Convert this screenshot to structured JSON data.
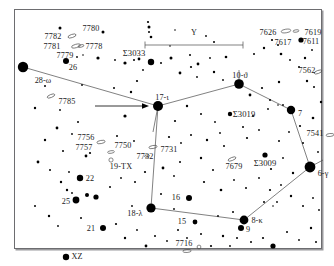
{
  "chart": {
    "title": "",
    "type": "star-chart",
    "target_marker": {
      "type": "arrow",
      "points_to": "17-i",
      "note": "horizontal arrow pointing right at the star labelled 17-i"
    },
    "scale_bar": {
      "label": "",
      "shown": true
    },
    "colors": {
      "background": "#ffffff",
      "star": "#000000",
      "constellation_line": "#4a4a4a",
      "frame": "#6d6d70",
      "label": "#1a1a1a"
    }
  },
  "labels": [
    {
      "id": "l1",
      "text": "7782",
      "x": 38,
      "y": 27,
      "kind": "num"
    },
    {
      "id": "l2",
      "text": "7780",
      "x": 76,
      "y": 19,
      "kind": "num"
    },
    {
      "id": "l3",
      "text": "7781",
      "x": 37,
      "y": 37,
      "kind": "num"
    },
    {
      "id": "l4",
      "text": "7778",
      "x": 79,
      "y": 37,
      "kind": "num"
    },
    {
      "id": "l5",
      "text": "7779",
      "x": 50,
      "y": 46,
      "kind": "num"
    },
    {
      "id": "l6",
      "text": "26",
      "x": 58,
      "y": 58,
      "kind": "num"
    },
    {
      "id": "l7",
      "text": "Σ3033",
      "x": 119,
      "y": 43,
      "kind": "sz"
    },
    {
      "id": "l8",
      "text": "Y",
      "x": 179,
      "y": 23,
      "kind": "bayer"
    },
    {
      "id": "l9",
      "text": "7626",
      "x": 253,
      "y": 23,
      "kind": "num"
    },
    {
      "id": "l10",
      "text": "7619",
      "x": 298,
      "y": 23,
      "kind": "num"
    },
    {
      "id": "l11",
      "text": "7617",
      "x": 268,
      "y": 33,
      "kind": "num"
    },
    {
      "id": "l12",
      "text": "7611",
      "x": 296,
      "y": 32,
      "kind": "num"
    },
    {
      "id": "l13",
      "text": "7562",
      "x": 292,
      "y": 61,
      "kind": "num"
    },
    {
      "id": "l14",
      "text": "28-ω",
      "x": 28,
      "y": 71,
      "kind": "bayer"
    },
    {
      "id": "l15",
      "text": "10-ϑ",
      "x": 225,
      "y": 66,
      "kind": "bayer"
    },
    {
      "id": "l16",
      "text": "17-ι",
      "x": 147,
      "y": 88,
      "kind": "bayer"
    },
    {
      "id": "l17",
      "text": "7785",
      "x": 52,
      "y": 92,
      "kind": "num"
    },
    {
      "id": "l18",
      "text": "Σ3019",
      "x": 229,
      "y": 104,
      "kind": "sz"
    },
    {
      "id": "l19",
      "text": "7",
      "x": 285,
      "y": 104,
      "kind": "num"
    },
    {
      "id": "l20",
      "text": "7541",
      "x": 300,
      "y": 124,
      "kind": "num"
    },
    {
      "id": "l21",
      "text": "7756",
      "x": 71,
      "y": 128,
      "kind": "num"
    },
    {
      "id": "l22",
      "text": "7757",
      "x": 69,
      "y": 138,
      "kind": "num"
    },
    {
      "id": "l23",
      "text": "7750",
      "x": 108,
      "y": 136,
      "kind": "num"
    },
    {
      "id": "l24",
      "text": "7731",
      "x": 154,
      "y": 140,
      "kind": "num"
    },
    {
      "id": "l25",
      "text": "7732",
      "x": 130,
      "y": 147,
      "kind": "num"
    },
    {
      "id": "l26",
      "text": "19-TX",
      "x": 106,
      "y": 157,
      "kind": "bayer"
    },
    {
      "id": "l27",
      "text": "7679",
      "x": 219,
      "y": 157,
      "kind": "num"
    },
    {
      "id": "l28",
      "text": "Σ3009",
      "x": 250,
      "y": 153,
      "kind": "sz"
    },
    {
      "id": "l29",
      "text": "6-γ",
      "x": 308,
      "y": 164,
      "kind": "bayer"
    },
    {
      "id": "l30",
      "text": "22",
      "x": 75,
      "y": 169,
      "kind": "num"
    },
    {
      "id": "l31",
      "text": "25",
      "x": 51,
      "y": 192,
      "kind": "num"
    },
    {
      "id": "l32",
      "text": "16",
      "x": 161,
      "y": 188,
      "kind": "num"
    },
    {
      "id": "l33",
      "text": "18-λ",
      "x": 120,
      "y": 204,
      "kind": "bayer"
    },
    {
      "id": "l34",
      "text": "8-κ",
      "x": 242,
      "y": 211,
      "kind": "bayer"
    },
    {
      "id": "l35",
      "text": "15",
      "x": 167,
      "y": 212,
      "kind": "num"
    },
    {
      "id": "l36",
      "text": "9",
      "x": 233,
      "y": 220,
      "kind": "num"
    },
    {
      "id": "l37",
      "text": "21",
      "x": 76,
      "y": 219,
      "kind": "num"
    },
    {
      "id": "l38",
      "text": "7716",
      "x": 169,
      "y": 234,
      "kind": "num"
    },
    {
      "id": "l39",
      "text": "XZ",
      "x": 62,
      "y": 247,
      "kind": "bayer"
    }
  ],
  "chart_data": {
    "type": "scatter",
    "xlabel": "",
    "ylabel": "",
    "xlim": [
      0,
      308
    ],
    "ylim": [
      0,
      240
    ],
    "grid": false,
    "legend": "none",
    "note": "Dot radius encodes stellar magnitude: larger dot = brighter star.",
    "named_stars": [
      {
        "name": "28-ω",
        "x": 8,
        "y": 57,
        "r": 5.2
      },
      {
        "name": "26",
        "x": 51,
        "y": 51,
        "r": 3.0
      },
      {
        "name": "17-ι",
        "x": 143,
        "y": 96,
        "r": 5.0
      },
      {
        "name": "10-ϑ",
        "x": 224,
        "y": 74,
        "r": 4.8
      },
      {
        "name": "7",
        "x": 276,
        "y": 100,
        "r": 4.2
      },
      {
        "name": "6-γ",
        "x": 295,
        "y": 157,
        "r": 5.4
      },
      {
        "name": "18-λ",
        "x": 136,
        "y": 198,
        "r": 4.6
      },
      {
        "name": "8-κ",
        "x": 229,
        "y": 210,
        "r": 4.4
      },
      {
        "name": "9",
        "x": 226,
        "y": 218,
        "r": 3.0
      },
      {
        "name": "16",
        "x": 174,
        "y": 188,
        "r": 3.0
      },
      {
        "name": "15",
        "x": 180,
        "y": 212,
        "r": 2.4
      },
      {
        "name": "22",
        "x": 65,
        "y": 168,
        "r": 3.2
      },
      {
        "name": "25",
        "x": 61,
        "y": 190,
        "r": 3.4
      },
      {
        "name": "21",
        "x": 88,
        "y": 218,
        "r": 3.0
      },
      {
        "name": "XZ",
        "x": 51,
        "y": 247,
        "r": 3.2
      },
      {
        "name": "Σ3033",
        "x": 136,
        "y": 52,
        "r": 3.2
      },
      {
        "name": "Σ3019",
        "x": 215,
        "y": 104,
        "r": 2.2
      },
      {
        "name": "Σ3009",
        "x": 250,
        "y": 145,
        "r": 2.6
      },
      {
        "name": "7611",
        "x": 286,
        "y": 30,
        "r": 2.6
      },
      {
        "name": "7617",
        "x": 279,
        "y": 26,
        "r": 1.6
      }
    ],
    "constellation_lines": [
      {
        "from": "28-ω",
        "to": "17-ι"
      },
      {
        "from": "17-ι",
        "to": "10-ϑ"
      },
      {
        "from": "10-ϑ",
        "to": "7"
      },
      {
        "from": "7",
        "to": "6-γ"
      },
      {
        "from": "6-γ",
        "to": "8-κ"
      },
      {
        "from": "8-κ",
        "to": "18-λ"
      },
      {
        "from": "18-λ",
        "to": "17-ι"
      }
    ]
  }
}
